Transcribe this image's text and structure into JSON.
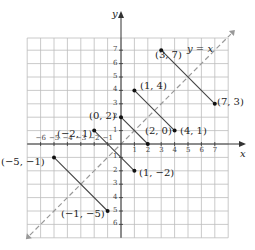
{
  "figure": {
    "x_axis_label": "x",
    "y_axis_label": "y",
    "line_label": "y = x",
    "x_ticks": [
      "-6",
      "-5",
      "-4",
      "-3",
      "-2",
      "-1",
      "1",
      "2",
      "3",
      "4",
      "5",
      "6",
      "7"
    ],
    "y_ticks": [
      "7",
      "6",
      "5",
      "4",
      "3",
      "2",
      "1",
      "-1",
      "-2",
      "-3",
      "-4",
      "-5",
      "-6"
    ],
    "points": [
      {
        "label": "(3, 7)",
        "x": 3,
        "y": 7
      },
      {
        "label": "(7, 3)",
        "x": 7,
        "y": 3
      },
      {
        "label": "(1, 4)",
        "x": 1,
        "y": 4
      },
      {
        "label": "(4, 1)",
        "x": 4,
        "y": 1
      },
      {
        "label": "(0, 2)",
        "x": 0,
        "y": 2
      },
      {
        "label": "(2, 0)",
        "x": 2,
        "y": 0
      },
      {
        "label": "(−2, 1)",
        "x": -2,
        "y": 1
      },
      {
        "label": "(1, −2)",
        "x": 1,
        "y": -2
      },
      {
        "label": "(−5, −1)",
        "x": -5,
        "y": -1
      },
      {
        "label": "(−1, −5)",
        "x": -1,
        "y": -5
      }
    ],
    "segments": [
      {
        "from": [
          3,
          7
        ],
        "to": [
          7,
          3
        ]
      },
      {
        "from": [
          1,
          4
        ],
        "to": [
          4,
          1
        ]
      },
      {
        "from": [
          0,
          2
        ],
        "to": [
          2,
          0
        ]
      },
      {
        "from": [
          -2,
          1
        ],
        "to": [
          1,
          -2
        ]
      },
      {
        "from": [
          -5,
          -1
        ],
        "to": [
          -1,
          -5
        ]
      }
    ],
    "colors": {
      "grid": "#bdbdbd",
      "axis": "#333333",
      "segment": "#444444",
      "dashed": "#999999",
      "point": "#111111"
    }
  }
}
